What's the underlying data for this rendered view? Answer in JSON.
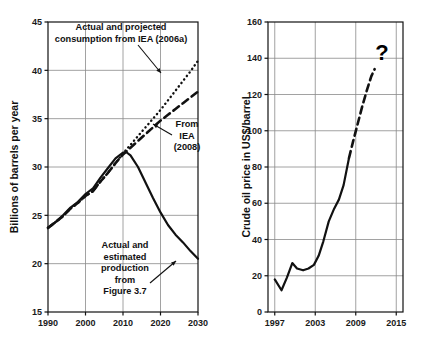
{
  "figure": {
    "name": "oil-consumption-and-price-figure",
    "background": "#ffffff",
    "ink": "#111111",
    "grid_color": "#8a8a8a"
  },
  "chart_data": [
    {
      "id": "left",
      "type": "line",
      "title": "",
      "xlabel": "",
      "ylabel": "Billions of barrels per year",
      "xlim": [
        1990,
        2030
      ],
      "ylim": [
        15,
        45
      ],
      "xticks": [
        1990,
        2000,
        2010,
        2020,
        2030
      ],
      "xticklabels": [
        "1990",
        "2000",
        "2010",
        "2020",
        "2030"
      ],
      "yticks": [
        15,
        20,
        25,
        30,
        35,
        40,
        45
      ],
      "yticklabels": [
        "15",
        "20",
        "25",
        "30",
        "35",
        "40",
        "45"
      ],
      "grid": true,
      "legend": "none",
      "annotations": [
        {
          "name": "iea-2006a-annotation",
          "text_lines": [
            "Actual and projected",
            "consumption from IEA (2006a)"
          ],
          "arrow": true,
          "target_series": "Actual and projected consumption from IEA (2006a)"
        },
        {
          "name": "iea-2008-annotation",
          "text_lines": [
            "From",
            "IEA",
            "(2008)"
          ],
          "arrow": true,
          "target_series": "From IEA (2008)"
        },
        {
          "name": "production-annotation",
          "text_lines": [
            "Actual and",
            "estimated",
            "production",
            "from",
            "Figure 3.7"
          ],
          "arrow": true,
          "target_series": "Actual and estimated production from Figure 3.7"
        }
      ],
      "series": [
        {
          "name": "Actual and projected consumption from IEA (2006a)",
          "style": "dotted",
          "x": [
            1990,
            1992,
            1994,
            1996,
            1998,
            2000,
            2002,
            2004,
            2006,
            2008,
            2010,
            2012,
            2014,
            2016,
            2018,
            2020,
            2022,
            2024,
            2026,
            2028,
            2030
          ],
          "y": [
            23.7,
            24.3,
            24.9,
            25.7,
            26.3,
            27.0,
            27.5,
            28.5,
            29.4,
            30.4,
            31.4,
            32.3,
            33.2,
            34.1,
            35.0,
            35.9,
            36.9,
            37.9,
            38.9,
            39.9,
            41.0
          ]
        },
        {
          "name": "From IEA (2008)",
          "style": "dashed",
          "x": [
            1990,
            1992,
            1994,
            1996,
            1998,
            2000,
            2002,
            2004,
            2006,
            2008,
            2010,
            2012,
            2014,
            2016,
            2018,
            2020,
            2022,
            2024,
            2026,
            2028,
            2030
          ],
          "y": [
            23.7,
            24.3,
            24.9,
            25.7,
            26.3,
            27.0,
            27.5,
            28.5,
            29.4,
            30.4,
            31.3,
            32.0,
            32.7,
            33.4,
            34.1,
            34.8,
            35.4,
            36.0,
            36.6,
            37.2,
            37.8
          ]
        },
        {
          "name": "Actual and estimated production from Figure 3.7",
          "style": "solid",
          "x": [
            1990,
            1992,
            1994,
            1996,
            1998,
            2000,
            2002,
            2004,
            2006,
            2008,
            2010,
            2011,
            2012,
            2014,
            2016,
            2018,
            2020,
            2022,
            2024,
            2026,
            2028,
            2030
          ],
          "y": [
            23.7,
            24.3,
            25.0,
            25.8,
            26.4,
            27.2,
            27.8,
            28.9,
            29.9,
            30.9,
            31.5,
            31.5,
            31.2,
            30.0,
            28.4,
            26.8,
            25.3,
            24.0,
            23.0,
            22.2,
            21.3,
            20.5
          ]
        }
      ]
    },
    {
      "id": "right",
      "type": "line",
      "title": "",
      "xlabel": "",
      "ylabel": "Crude oil price in US$/barrel",
      "xlim": [
        1996,
        2016
      ],
      "ylim": [
        0,
        160
      ],
      "xticks": [
        1997,
        2003,
        2009,
        2015
      ],
      "xticklabels": [
        "1997",
        "2003",
        "2009",
        "2015"
      ],
      "yticks": [
        0,
        20,
        40,
        60,
        80,
        100,
        120,
        140,
        160
      ],
      "yticklabels": [
        "0",
        "20",
        "40",
        "60",
        "80",
        "100",
        "120",
        "140",
        "160"
      ],
      "grid": true,
      "legend": "none",
      "annotations": [
        {
          "name": "question-mark-annotation",
          "text_lines": [
            "?"
          ],
          "arrow": false,
          "target_series": "Crude oil price projection"
        }
      ],
      "series": [
        {
          "name": "Crude oil price",
          "style": "solid",
          "x": [
            1997.0,
            1998.0,
            1998.8,
            1999.6,
            2000.3,
            2001.2,
            2002.0,
            2002.8,
            2003.5,
            2004.2,
            2005.0,
            2005.8,
            2006.5,
            2007.2,
            2008.0
          ],
          "y": [
            18,
            12,
            19,
            27,
            24,
            23,
            24,
            26,
            31,
            39,
            50,
            57,
            62,
            70,
            85
          ]
        },
        {
          "name": "Crude oil price projection",
          "style": "dashed",
          "x": [
            2008.0,
            2008.6,
            2009.3,
            2010.0,
            2010.7,
            2011.3,
            2011.8
          ],
          "y": [
            85,
            94,
            104,
            114,
            123,
            130,
            134
          ]
        }
      ]
    }
  ]
}
